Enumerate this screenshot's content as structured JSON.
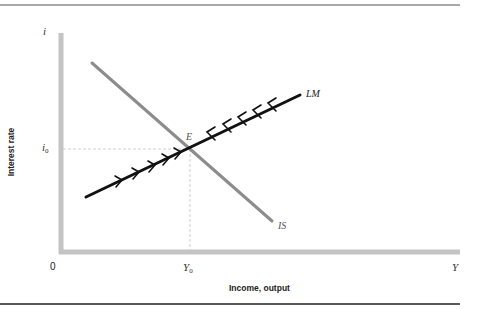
{
  "figure": {
    "axes": {
      "y_axis_symbol": "i",
      "x_axis_symbol": "Y",
      "origin_label": "0",
      "y_axis_title": "Interest rate",
      "x_axis_title": "Income, output",
      "y_tick_label": "i",
      "y_tick_sub": "0",
      "x_tick_label": "Y",
      "x_tick_sub": "0"
    },
    "curves": {
      "is_label": "IS",
      "lm_label": "LM",
      "equilibrium_label": "E"
    },
    "colors": {
      "axis": "#c4c4c4",
      "is_curve": "#8c8c8c",
      "lm_curve": "#111111",
      "guide": "#d0d0d0",
      "top_rule": "#a8a8a8",
      "bottom_rule": "#5a5a5a"
    }
  }
}
